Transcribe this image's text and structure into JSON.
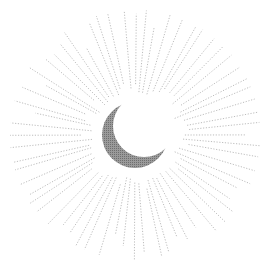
{
  "illustration": {
    "subject": "crescent moon with radiating sunburst rays",
    "background": "#ffffff",
    "center": [
      135,
      135
    ],
    "moon": {
      "outer_radius": 33,
      "inner_offset": [
        9,
        -9
      ],
      "inner_radius": 31,
      "fill": "#8a8a8a"
    },
    "rays": {
      "count": 64,
      "inner_radius": 42,
      "min_length": 55,
      "max_length": 112,
      "color": "#b5b5b5",
      "dash": "1.2 1.6",
      "width": 0.9
    }
  }
}
